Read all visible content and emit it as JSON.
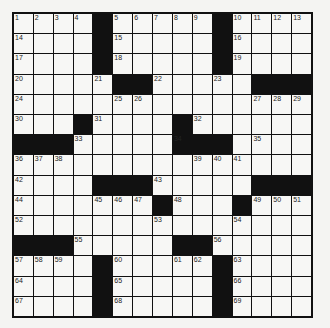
{
  "puzzle": {
    "rows": 15,
    "cols": 15,
    "grid": [
      ".....#.....#....",
      "x"
    ],
    "layout": [
      "....#.....#....",
      "....#.....#....",
      "....#.....#....",
      ".....##.....###",
      "...............",
      "...#....#......",
      "###.....###....",
      "...............",
      "....###.....###",
      ".......#...#...",
      "...............",
      "###.....##.....",
      "....#.....#....",
      "....#.....#....",
      "....#.....#...."
    ],
    "numbers": {
      "0,0": "1",
      "0,1": "2",
      "0,2": "3",
      "0,3": "4",
      "0,5": "5",
      "0,6": "6",
      "0,7": "7",
      "0,8": "8",
      "0,9": "9",
      "0,11": "10",
      "0,12": "11",
      "0,13": "12",
      "0,14": "13",
      "1,0": "14",
      "1,5": "15",
      "1,11": "16",
      "2,0": "17",
      "2,5": "18",
      "2,11": "19",
      "3,0": "20",
      "3,4": "21",
      "3,7": "22",
      "3,10": "23",
      "4,0": "24",
      "4,5": "25",
      "4,6": "26",
      "4,12": "27",
      "4,13": "28",
      "4,14": "29",
      "5,0": "30",
      "5,4": "31",
      "5,9": "32",
      "6,3": "33",
      "6,8": "34",
      "6,12": "35",
      "7,0": "36",
      "7,1": "37",
      "7,2": "38",
      "7,9": "39",
      "7,10": "40",
      "7,11": "41",
      "8,0": "42",
      "8,7": "43",
      "9,0": "44",
      "9,4": "45",
      "9,5": "46",
      "9,6": "47",
      "9,8": "48",
      "9,12": "49",
      "9,13": "50",
      "9,14": "51",
      "10,0": "52",
      "10,7": "53",
      "10,11": "54",
      "11,3": "55",
      "11,10": "56",
      "12,0": "57",
      "12,1": "58",
      "12,2": "59",
      "12,5": "60",
      "12,8": "61",
      "12,9": "62",
      "12,11": "63",
      "13,0": "64",
      "13,5": "65",
      "13,11": "66",
      "14,0": "67",
      "14,5": "68",
      "14,11": "69"
    }
  }
}
